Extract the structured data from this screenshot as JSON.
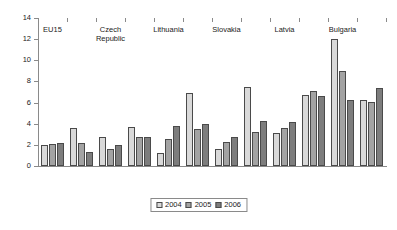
{
  "chart_data": {
    "type": "bar",
    "title": "",
    "subtitle": "",
    "xlabel": "",
    "ylabel": "",
    "ylim": [
      0,
      14
    ],
    "ytick_step": 2,
    "yticks": [
      0,
      2,
      4,
      6,
      8,
      10,
      12,
      14
    ],
    "grid": false,
    "legend_position": "bottom-center",
    "categories": [
      "EU15",
      "",
      "Czech\nRepublic",
      "",
      "Lithuania",
      "",
      "Slovakia",
      "",
      "Latvia",
      "",
      "Bulgaria"
    ],
    "axis_labels": [
      {
        "index": 0,
        "label": "EU15"
      },
      {
        "index": 2,
        "label": "Czech\nRepublic"
      },
      {
        "index": 4,
        "label": "Lithuania"
      },
      {
        "index": 6,
        "label": "Slovakia"
      },
      {
        "index": 8,
        "label": "Latvia"
      },
      {
        "index": 10,
        "label": "Bulgaria"
      }
    ],
    "series": [
      {
        "name": "2004",
        "color": "#d9d9d9",
        "values": [
          2.0,
          3.6,
          2.7,
          3.7,
          1.2,
          6.9,
          1.6,
          7.5,
          3.1,
          6.7,
          12.0
        ]
      },
      {
        "name": "2005",
        "color": "#a3a3a3",
        "values": [
          2.1,
          2.2,
          1.6,
          2.7,
          2.6,
          3.5,
          2.3,
          3.2,
          3.6,
          7.1,
          9.0
        ]
      },
      {
        "name": "2006",
        "color": "#7d7d7d",
        "values": [
          2.2,
          1.3,
          2.0,
          2.7,
          3.8,
          4.0,
          2.7,
          4.3,
          4.2,
          6.6,
          6.2
        ]
      }
    ],
    "extra_group": {
      "note": "final cluster",
      "values": [
        6.2,
        6.1,
        7.4
      ]
    }
  },
  "legend": {
    "items": [
      {
        "label": "2004",
        "color": "#d9d9d9"
      },
      {
        "label": "2005",
        "color": "#a3a3a3"
      },
      {
        "label": "2006",
        "color": "#7d7d7d"
      }
    ]
  },
  "colors": {
    "series_2004": "#d9d9d9",
    "series_2005": "#a3a3a3",
    "series_2006": "#7d7d7d",
    "axis": "#8a8a8a",
    "bar_outline": "#4a4a4a",
    "text": "#1a1a1a",
    "background": "#ffffff"
  }
}
